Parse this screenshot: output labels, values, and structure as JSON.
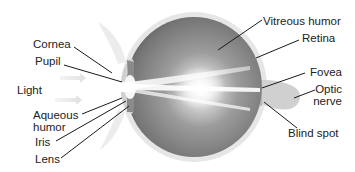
{
  "diagram": {
    "labels_left": [
      {
        "id": "cornea",
        "text": "Cornea"
      },
      {
        "id": "pupil",
        "text": "Pupil"
      },
      {
        "id": "light",
        "text": "Light"
      },
      {
        "id": "aqueous",
        "line1": "Aqueous",
        "line2": "humor"
      },
      {
        "id": "iris",
        "text": "Iris"
      },
      {
        "id": "lens",
        "text": "Lens"
      }
    ],
    "labels_right": [
      {
        "id": "vitreous",
        "text": "Vitreous humor"
      },
      {
        "id": "retina",
        "text": "Retina"
      },
      {
        "id": "fovea",
        "text": "Fovea"
      },
      {
        "id": "optic",
        "line1": "Optic",
        "line2": "nerve"
      },
      {
        "id": "blind",
        "text": "Blind spot"
      }
    ],
    "colors": {
      "eyeball_dark": "#6e6e6e",
      "eyeball_mid": "#9a9a9a",
      "sclera": "#e4e4e4",
      "light_ray": "#ffffff",
      "leader_line": "#1a1a1a",
      "text": "#222222",
      "optic_nerve": "#cfcfcf"
    }
  }
}
